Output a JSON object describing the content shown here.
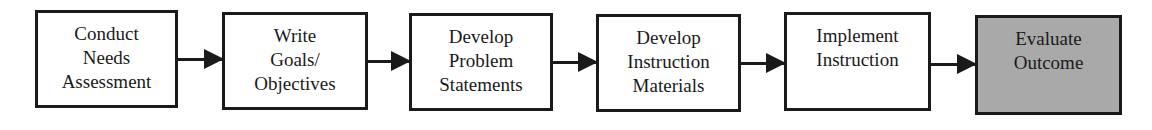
{
  "diagram": {
    "type": "flowchart",
    "direction": "left-to-right",
    "highlight_color": "#a9a9a9",
    "steps": [
      {
        "lines": [
          "Conduct",
          "Needs",
          "Assessment"
        ]
      },
      {
        "lines": [
          "Write",
          "Goals/",
          "Objectives"
        ]
      },
      {
        "lines": [
          "Develop",
          "Problem",
          "Statements"
        ]
      },
      {
        "lines": [
          "Develop",
          "Instruction",
          "Materials"
        ]
      },
      {
        "lines": [
          "Implement",
          "Instruction"
        ]
      },
      {
        "lines": [
          "Evaluate",
          "Outcome"
        ],
        "highlighted": true
      }
    ],
    "edges": [
      {
        "from": 0,
        "to": 1
      },
      {
        "from": 1,
        "to": 2
      },
      {
        "from": 2,
        "to": 3
      },
      {
        "from": 3,
        "to": 4
      },
      {
        "from": 4,
        "to": 5
      }
    ]
  }
}
